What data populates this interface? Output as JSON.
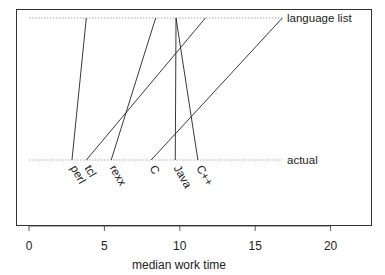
{
  "chart_data": {
    "type": "line",
    "title": "",
    "xlabel": "median work time",
    "ylabel": "",
    "xlim": [
      -0.9,
      22.6
    ],
    "x_ticks": [
      0,
      5,
      10,
      15,
      20
    ],
    "x_tick_labels": [
      "0",
      "5",
      "10",
      "15",
      "20"
    ],
    "grid": false,
    "levels": [
      {
        "name": "language list",
        "position": "top"
      },
      {
        "name": "actual",
        "position": "bottom"
      }
    ],
    "series": [
      {
        "name": "perl",
        "language_list": 3.8,
        "actual": 2.85
      },
      {
        "name": "tcl",
        "language_list": 11.7,
        "actual": 3.8
      },
      {
        "name": "rexx",
        "language_list": 8.4,
        "actual": 5.45
      },
      {
        "name": "C",
        "language_list": 16.8,
        "actual": 8.1
      },
      {
        "name": "Java",
        "language_list": 9.75,
        "actual": 9.7
      },
      {
        "name": "C++",
        "language_list": 9.75,
        "actual": 11.2
      }
    ]
  }
}
